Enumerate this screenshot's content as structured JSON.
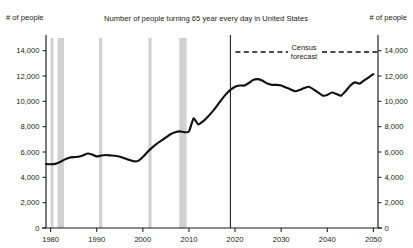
{
  "header": {
    "title": "Number of people turning 65 year every day in United States",
    "left_axis_label": "# of people",
    "right_axis_label": "# of people"
  },
  "legend": {
    "label_line1": "Census",
    "label_line2": "forecast"
  },
  "chart_data": {
    "type": "line",
    "title": "Number of people turning 65 year every day in United States",
    "xlabel": "",
    "ylabel": "# of people",
    "y2label": "# of people",
    "xlim": [
      1979,
      2051
    ],
    "ylim": [
      0,
      15000
    ],
    "grid": false,
    "legend_position": "top-center",
    "legend_entries": [
      "Census forecast"
    ],
    "x_ticks": [
      1980,
      1990,
      2000,
      2010,
      2020,
      2030,
      2040,
      2050
    ],
    "x_tick_labels": [
      "1980",
      "1990",
      "2000",
      "2010",
      "2020",
      "2030",
      "2040",
      "2050"
    ],
    "y_ticks": [
      0,
      2000,
      4000,
      6000,
      8000,
      10000,
      12000,
      14000
    ],
    "y_tick_labels": [
      "0",
      "2,000",
      "4,000",
      "6,000",
      "8,000",
      "10,000",
      "12,000",
      "14,000"
    ],
    "y2_ticks": [
      0,
      2000,
      4000,
      6000,
      8000,
      10000,
      12000,
      14000
    ],
    "y2_tick_labels": [
      "0",
      "2,000",
      "4,000",
      "6,000",
      "8,000",
      "10,000",
      "12,000",
      "14,000"
    ],
    "forecast_divider_x": 2019,
    "recession_bands": [
      {
        "start": 1980.0,
        "end": 1980.6
      },
      {
        "start": 1981.5,
        "end": 1982.9
      },
      {
        "start": 1990.5,
        "end": 1991.2
      },
      {
        "start": 2001.2,
        "end": 2001.9
      },
      {
        "start": 2007.9,
        "end": 2009.5
      }
    ],
    "series": [
      {
        "name": "People turning 65 per day",
        "x": [
          1979,
          1980,
          1981,
          1982,
          1983,
          1984,
          1985,
          1986,
          1987,
          1988,
          1989,
          1990,
          1991,
          1992,
          1993,
          1994,
          1995,
          1996,
          1997,
          1998,
          1999,
          2000,
          2001,
          2002,
          2003,
          2004,
          2005,
          2006,
          2007,
          2008,
          2009,
          2010,
          2011,
          2012,
          2013,
          2014,
          2015,
          2016,
          2017,
          2018,
          2019,
          2020,
          2021,
          2022,
          2023,
          2024,
          2025,
          2026,
          2027,
          2028,
          2029,
          2030,
          2031,
          2032,
          2033,
          2034,
          2035,
          2036,
          2037,
          2038,
          2039,
          2040,
          2041,
          2042,
          2043,
          2044,
          2045,
          2046,
          2047,
          2048,
          2049,
          2050
        ],
        "y": [
          5050,
          5030,
          5060,
          5200,
          5400,
          5550,
          5600,
          5620,
          5720,
          5880,
          5800,
          5650,
          5720,
          5760,
          5730,
          5700,
          5630,
          5500,
          5380,
          5270,
          5300,
          5600,
          6000,
          6350,
          6650,
          6900,
          7150,
          7400,
          7560,
          7630,
          7560,
          7620,
          8650,
          8180,
          8400,
          8750,
          9150,
          9600,
          10100,
          10550,
          10900,
          11150,
          11250,
          11250,
          11450,
          11700,
          11750,
          11620,
          11400,
          11300,
          11300,
          11250,
          11100,
          10950,
          10800,
          10900,
          11050,
          11150,
          10950,
          10700,
          10450,
          10500,
          10700,
          10580,
          10450,
          10820,
          11250,
          11500,
          11400,
          11650,
          11900,
          12150
        ]
      }
    ]
  }
}
